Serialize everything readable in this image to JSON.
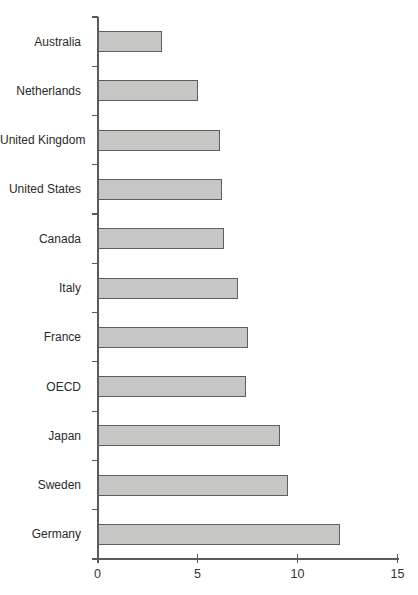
{
  "chart_data": {
    "type": "bar",
    "orientation": "horizontal",
    "title": "",
    "xlabel": "",
    "ylabel": "",
    "categories": [
      "Australia",
      "Netherlands",
      "United Kingdom",
      "United States",
      "Canada",
      "Italy",
      "France",
      "OECD",
      "Japan",
      "Sweden",
      "Germany"
    ],
    "values": [
      3.2,
      5.0,
      6.1,
      6.2,
      6.3,
      7.0,
      7.5,
      7.4,
      9.1,
      9.5,
      12.1
    ],
    "xlim": [
      0,
      15
    ],
    "x_ticks": [
      0,
      5,
      10,
      15
    ],
    "grid": false,
    "legend_position": "none",
    "colors": {
      "bar_fill": "#c6c7c4",
      "bar_border": "#5f5f5f",
      "axis": "#5a5a5a",
      "category_label": "#2a2a2a",
      "tick_label": "#333333",
      "background": "#ffffff"
    }
  }
}
